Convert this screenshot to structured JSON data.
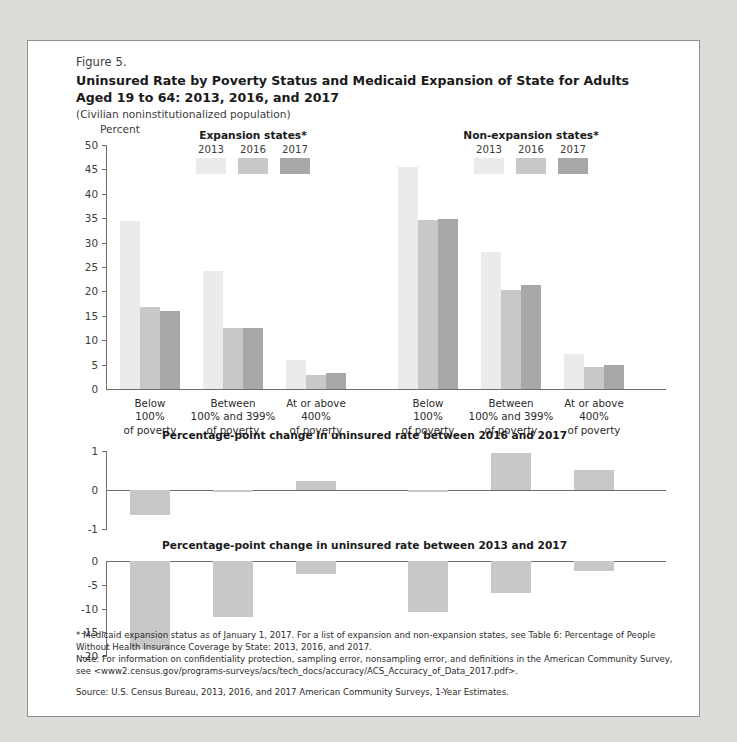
{
  "figure": {
    "number": "Figure 5.",
    "title_line1": "Uninsured Rate by Poverty Status and Medicaid Expansion of State for Adults",
    "title_line2": "Aged 19 to 64: 2013, 2016, and 2017",
    "subtitle": "(Civilian noninstitutionalized population)",
    "axis_title": "Percent"
  },
  "legends": [
    {
      "title": "Expansion states*",
      "years": [
        "2013",
        "2016",
        "2017"
      ]
    },
    {
      "title": "Non-expansion states*",
      "years": [
        "2013",
        "2016",
        "2017"
      ]
    }
  ],
  "colors": {
    "series_2013": "#ebebeb",
    "series_2016": "#c8c8c8",
    "series_2017": "#a8a8a8",
    "change_bar": "#c8c8c8",
    "axis": "#6e6e6e",
    "text": "#2b2b2b",
    "page_background": "#dcdcd8",
    "figure_background": "#ffffff"
  },
  "footnotes": {
    "note_star": "* Medicaid expansion status as of January 1, 2017. For a list of expansion and non-expansion states, see Table 6: Percentage of People Without Health Insurance Coverage by State: 2013, 2016, and 2017.",
    "note_general": "Note: For information on confidentiality protection, sampling error, nonsampling error, and definitions in the American Community Survey, see <www2.census.gov/programs-surveys/acs/tech_docs/accuracy/ACS_Accuracy_of_Data_2017.pdf>.",
    "source": "Source: U.S. Census Bureau, 2013, 2016, and 2017 American Community Surveys, 1-Year Estimates."
  },
  "chart_data": [
    {
      "type": "bar",
      "title": "Uninsured Rate by Poverty Status and Medicaid Expansion of State for Adults Aged 19 to 64: 2013, 2016, and 2017",
      "xlabel": "",
      "ylabel": "Percent",
      "ylim": [
        0,
        50
      ],
      "yticks": [
        0,
        5,
        10,
        15,
        20,
        25,
        30,
        35,
        40,
        45,
        50
      ],
      "grid": false,
      "legend_position": "top",
      "groups": [
        "Expansion states*",
        "Non-expansion states*"
      ],
      "categories": [
        "Below\n100%\nof poverty",
        "Between\n100% and 399%\nof poverty",
        "At or above\n400%\nof poverty"
      ],
      "category_lines": [
        [
          "Below",
          "100%",
          "of poverty"
        ],
        [
          "Between",
          "100% and 399%",
          "of poverty"
        ],
        [
          "At or above",
          "400%",
          "of poverty"
        ]
      ],
      "series": [
        {
          "name": "2013",
          "group": "Expansion states*",
          "values": [
            34.4,
            24.2,
            5.9
          ]
        },
        {
          "name": "2016",
          "group": "Expansion states*",
          "values": [
            16.8,
            12.6,
            2.9
          ]
        },
        {
          "name": "2017",
          "group": "Expansion states*",
          "values": [
            15.9,
            12.5,
            3.2
          ]
        },
        {
          "name": "2013",
          "group": "Non-expansion states*",
          "values": [
            45.5,
            28.0,
            7.1
          ]
        },
        {
          "name": "2016",
          "group": "Non-expansion states*",
          "values": [
            34.7,
            20.3,
            4.5
          ]
        },
        {
          "name": "2017",
          "group": "Non-expansion states*",
          "values": [
            34.8,
            21.3,
            5.0
          ]
        }
      ]
    },
    {
      "type": "bar",
      "title": "Percentage-point change in uninsured rate between 2016 and 2017",
      "ylim": [
        -1,
        1
      ],
      "yticks": [
        1,
        0,
        -1
      ],
      "grid": false,
      "categories": [
        "Expansion: Below 100%",
        "Expansion: 100-399%",
        "Expansion: 400%+",
        "Non-expansion: Below 100%",
        "Non-expansion: 100-399%",
        "Non-expansion: 400%+"
      ],
      "values": [
        -0.65,
        -0.06,
        0.22,
        -0.04,
        0.95,
        0.52
      ]
    },
    {
      "type": "bar",
      "title": "Percentage-point change in uninsured rate between 2013 and 2017",
      "ylim": [
        -20,
        0
      ],
      "yticks": [
        0,
        -5,
        -10,
        -15,
        -20
      ],
      "grid": false,
      "categories": [
        "Expansion: Below 100%",
        "Expansion: 100-399%",
        "Expansion: 400%+",
        "Non-expansion: Below 100%",
        "Non-expansion: 100-399%",
        "Non-expansion: 400%+"
      ],
      "values": [
        -18.5,
        -11.7,
        -2.7,
        -10.7,
        -6.7,
        -2.1
      ]
    }
  ]
}
